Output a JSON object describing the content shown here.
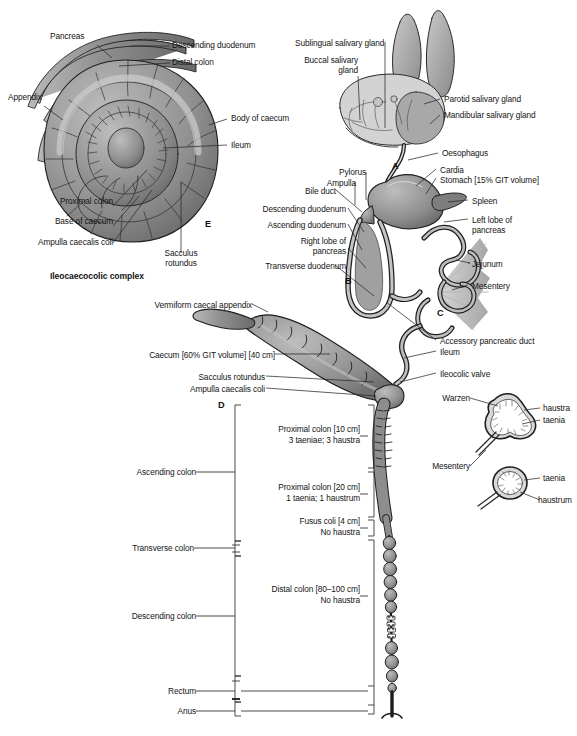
{
  "figure": {
    "background": "#ffffff",
    "tissue_fill": "#8d8d8d",
    "tissue_fill_light": "#b4b4b4",
    "tissue_fill_dark": "#6e6e6e",
    "outline": "#1e1e1e",
    "leader_line": "#2a2a2a"
  },
  "panel_markers": [
    {
      "id": "marker-a",
      "label": "A",
      "x": 392,
      "y": 166
    },
    {
      "id": "marker-b",
      "label": "B",
      "x": 345,
      "y": 281
    },
    {
      "id": "marker-c",
      "label": "C",
      "x": 437,
      "y": 313
    },
    {
      "id": "marker-d",
      "label": "D",
      "x": 220,
      "y": 404
    },
    {
      "id": "marker-e",
      "label": "E",
      "x": 206,
      "y": 224
    }
  ],
  "panel_e": {
    "caption": "Ileocaecocolic complex",
    "labels": [
      {
        "name": "pancreas",
        "text": "Pancreas"
      },
      {
        "name": "appendix",
        "text": "Appendix"
      },
      {
        "name": "proximal-colon",
        "text": "Proximal colon"
      },
      {
        "name": "base-of-caecum",
        "text": "Base of caecum"
      },
      {
        "name": "ampulla-caecalis-coli",
        "text": "Ampulla caecalis coli"
      },
      {
        "name": "descending-duodenum",
        "text": "Descending duodenum"
      },
      {
        "name": "distal-colon",
        "text": "Distal colon"
      },
      {
        "name": "body-of-caecum",
        "text": "Body of caecum"
      },
      {
        "name": "ileum",
        "text": "Ileum"
      },
      {
        "name": "sacculus-rotundus",
        "text": "Sacculus\nrotundus"
      }
    ]
  },
  "head_panel": {
    "labels": [
      {
        "name": "sublingual-salivary-gland",
        "text": "Sublingual salivary gland"
      },
      {
        "name": "buccal-salivary-gland",
        "text": "Buccal salivary\ngland"
      },
      {
        "name": "parotid-salivary-gland",
        "text": "Parotid salivary gland"
      },
      {
        "name": "mandibular-salivary-gland",
        "text": "Mandibular salivary gland"
      },
      {
        "name": "oesophagus",
        "text": "Oesophagus"
      }
    ]
  },
  "stomach_panel": {
    "labels": [
      {
        "name": "pylorus",
        "text": "Pylorus"
      },
      {
        "name": "ampulla",
        "text": "Ampulla"
      },
      {
        "name": "bile-duct",
        "text": "Bile duct"
      },
      {
        "name": "descending-duodenum",
        "text": "Descending duodenum"
      },
      {
        "name": "ascending-duodenum",
        "text": "Ascending duodenum"
      },
      {
        "name": "right-lobe-of-pancreas",
        "text": "Right lobe of\npancreas"
      },
      {
        "name": "transverse-duodenum",
        "text": "Transverse duodenum"
      },
      {
        "name": "cardia",
        "text": "Cardia"
      },
      {
        "name": "stomach",
        "text": "Stomach [15% GIT volume]"
      },
      {
        "name": "spleen",
        "text": "Spleen"
      },
      {
        "name": "left-lobe-of-pancreas",
        "text": "Left lobe of\npancreas"
      },
      {
        "name": "jejunum",
        "text": "Jejunum"
      },
      {
        "name": "mesentery",
        "text": "Mesentery"
      },
      {
        "name": "accessory-pancreatic-duct",
        "text": "Accessory pancreatic duct"
      },
      {
        "name": "ileum",
        "text": "Ileum"
      },
      {
        "name": "ileocolic-valve",
        "text": "Ileocolic valve"
      }
    ]
  },
  "caecum_panel": {
    "labels": [
      {
        "name": "vermiform-caecal-appendix",
        "text": "Vermiform caecal appendix"
      },
      {
        "name": "caecum",
        "text": "Caecum [60% GIT volume] [40 cm]"
      },
      {
        "name": "sacculus-rotundus",
        "text": "Sacculus rotundus"
      },
      {
        "name": "ampulla-caecalis-coli",
        "text": "Ampulla caecalis coli"
      }
    ]
  },
  "colon_panel": {
    "left_brackets": [
      {
        "name": "ascending-colon",
        "text": "Ascending colon"
      },
      {
        "name": "transverse-colon",
        "text": "Transverse colon"
      },
      {
        "name": "descending-colon",
        "text": "Descending colon"
      },
      {
        "name": "rectum",
        "text": "Rectum"
      },
      {
        "name": "anus",
        "text": "Anus"
      }
    ],
    "right_brackets": [
      {
        "name": "proximal-colon-10cm",
        "line1": "Proximal colon [10 cm]",
        "line2": "3 taeniae; 3 haustra"
      },
      {
        "name": "proximal-colon-20cm",
        "line1": "Proximal colon [20 cm]",
        "line2": "1 taenia; 1 haustrum"
      },
      {
        "name": "fusus-coli",
        "line1": "Fusus coli [4 cm]",
        "line2": "No haustra"
      },
      {
        "name": "distal-colon",
        "line1": "Distal colon [80–100 cm]",
        "line2": "No haustra"
      }
    ]
  },
  "cross_sections": {
    "upper": {
      "name": "proximal-colon-cross-section",
      "labels": [
        {
          "name": "warzen",
          "text": "Warzen"
        },
        {
          "name": "haustra",
          "text": "haustra"
        },
        {
          "name": "taenia",
          "text": "taenia"
        }
      ]
    },
    "lower": {
      "name": "distal-colon-cross-section",
      "labels": [
        {
          "name": "taenia",
          "text": "taenia"
        },
        {
          "name": "haustrum",
          "text": "haustrum"
        }
      ]
    },
    "shared": [
      {
        "name": "mesentery",
        "text": "Mesentery"
      }
    ]
  }
}
